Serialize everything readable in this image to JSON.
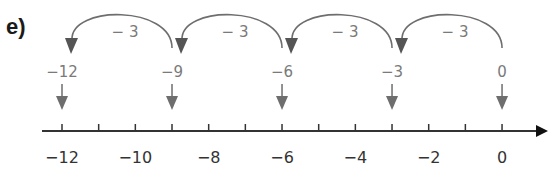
{
  "part_label": "e)",
  "colors": {
    "axis": "#333333",
    "jump": "#6e6e6e",
    "jump_text": "#7a7a7a",
    "tick_text": "#333333"
  },
  "number_line": {
    "min": -12,
    "max": 0,
    "tick_step": 1,
    "labels": [
      "−12",
      "−10",
      "−8",
      "−6",
      "−4",
      "−2",
      "0"
    ],
    "label_values": [
      -12,
      -10,
      -8,
      -6,
      -4,
      -2,
      0
    ]
  },
  "marked_points": [
    {
      "value": 0,
      "label": "0"
    },
    {
      "value": -3,
      "label": "−3"
    },
    {
      "value": -6,
      "label": "−6"
    },
    {
      "value": -9,
      "label": "−9"
    },
    {
      "value": -12,
      "label": "−12"
    }
  ],
  "jumps": [
    {
      "from": 0,
      "to": -3,
      "label": "− 3"
    },
    {
      "from": -3,
      "to": -6,
      "label": "− 3"
    },
    {
      "from": -6,
      "to": -9,
      "label": "− 3"
    },
    {
      "from": -9,
      "to": -12,
      "label": "− 3"
    }
  ]
}
